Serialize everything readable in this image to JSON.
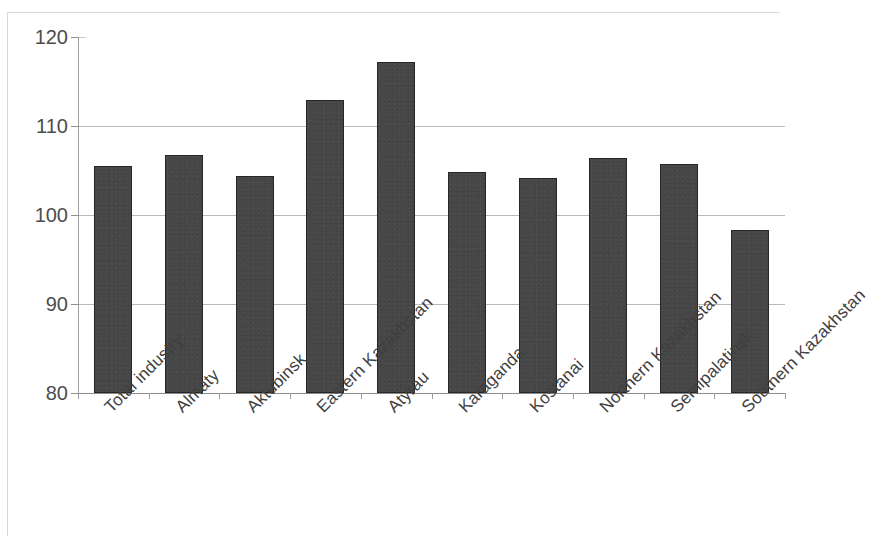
{
  "chart_data": {
    "type": "bar",
    "title": "",
    "subtitle": "",
    "xlabel": "",
    "ylabel": "",
    "categories": [
      "Total industry",
      "Almaty",
      "Aktubinsk",
      "Eastern Kazakhstan",
      "Atyrau",
      "Karaganda",
      "Kostanai",
      "Northern Kazakhstan",
      "Semipalatinsk",
      "Southern Kazakhstan"
    ],
    "values": [
      105.5,
      106.7,
      104.4,
      112.9,
      117.2,
      104.8,
      104.2,
      106.4,
      105.7,
      98.3
    ],
    "ylim": [
      80,
      120
    ],
    "ytick_labels": [
      "120",
      "110",
      "100",
      "90",
      "80"
    ],
    "yticks": [
      120,
      110,
      100,
      90,
      80
    ],
    "grid": true,
    "legend": null,
    "legend_position": "none",
    "bar_color": "#474747",
    "bar_edge_color": "#262626",
    "grid_color": "#b9b9b9",
    "axis_color": "#8f8f8f",
    "background_color": "#ffffff",
    "x_tick_label_rotation": -45
  }
}
